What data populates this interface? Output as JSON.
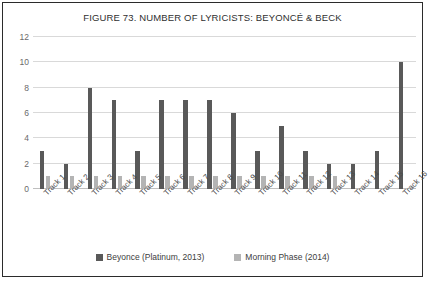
{
  "chart_data": {
    "type": "bar",
    "title": "FIGURE 73. NUMBER OF LYRICISTS: BEYONCÉ & BECK",
    "xlabel": "",
    "ylabel": "",
    "ylim": [
      0,
      12
    ],
    "yticks": [
      0,
      2,
      4,
      6,
      8,
      10,
      12
    ],
    "grid": true,
    "legend_position": "bottom",
    "categories": [
      "Track 1",
      "Track 2",
      "Track 3",
      "Track 4",
      "Track 5",
      "Track 6",
      "Track 7",
      "Track 8",
      "Track 9",
      "Track 10",
      "Track 11",
      "Track 12",
      "Track 13",
      "Track 14",
      "Track 15",
      "Track 16"
    ],
    "series": [
      {
        "name": "Beyonce (Platinum, 2013)",
        "color": "#595959",
        "values": [
          3,
          2,
          8,
          7,
          3,
          7,
          7,
          7,
          6,
          3,
          5,
          3,
          2,
          2,
          3,
          10
        ]
      },
      {
        "name": "Morning Phase (2014)",
        "color": "#b4b4b4",
        "values": [
          1,
          1,
          1,
          1,
          1,
          1,
          1,
          1,
          1,
          1,
          1,
          1,
          1,
          null,
          null,
          null
        ]
      }
    ]
  },
  "legend": {
    "items": [
      {
        "label": "Beyonce (Platinum, 2013)",
        "color": "#595959"
      },
      {
        "label": "Morning Phase (2014)",
        "color": "#b4b4b4"
      }
    ]
  }
}
